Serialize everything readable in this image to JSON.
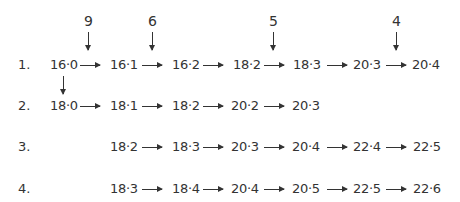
{
  "annotations": [
    {
      "label": "9",
      "x": 88
    },
    {
      "label": "6",
      "x": 152
    },
    {
      "label": "5",
      "x": 273
    },
    {
      "label": "4",
      "x": 396
    }
  ],
  "rows": [
    {
      "label": "1.",
      "items": [
        "16·0",
        "16·1",
        "16·2",
        "18·2",
        "18·3",
        "20·3",
        "20·4"
      ]
    },
    {
      "label": "2.",
      "items": [
        "18·0",
        "18·1",
        "18·2",
        "20·2",
        "20·3"
      ]
    },
    {
      "label": "3.",
      "items": [
        "18·2",
        "18·3",
        "20·3",
        "20·4",
        "22·4",
        "22·5"
      ]
    },
    {
      "label": "4.",
      "items": [
        "18·3",
        "18·4",
        "20·4",
        "20·5",
        "22·5",
        "22·6"
      ]
    }
  ]
}
